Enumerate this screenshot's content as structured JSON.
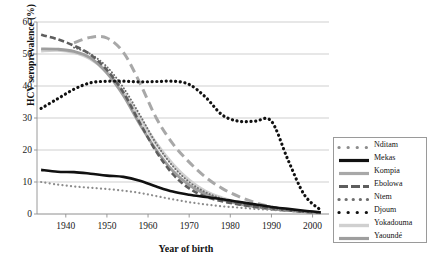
{
  "chart_data": {
    "type": "line",
    "title": "",
    "xlabel": "Year of birth",
    "ylabel": "HCV seroprevalence (%)",
    "xlim": [
      1933,
      2004
    ],
    "ylim": [
      0,
      60
    ],
    "xticks": [
      1940,
      1950,
      1960,
      1970,
      1980,
      1990,
      2000
    ],
    "yticks": [
      0,
      10,
      20,
      30,
      40,
      50,
      60
    ],
    "grid": "horizontal",
    "legend_position": "right",
    "series": [
      {
        "name": "Nditam",
        "color": "#8c8c8c",
        "style": "dotted-marker",
        "x": [
          1934,
          1938,
          1942,
          1946,
          1950,
          1954,
          1958,
          1962,
          1966,
          1970,
          1974,
          1978,
          1982,
          1986,
          1990,
          1994,
          1998,
          2002
        ],
        "values": [
          10.0,
          9.2,
          8.6,
          8.2,
          7.8,
          7.3,
          6.6,
          5.6,
          4.6,
          3.7,
          3.0,
          2.4,
          2.0,
          1.6,
          1.3,
          1.0,
          0.7,
          0.4
        ]
      },
      {
        "name": "Mekas",
        "color": "#111111",
        "style": "solid-thick",
        "x": [
          1934,
          1938,
          1942,
          1946,
          1950,
          1954,
          1958,
          1962,
          1966,
          1970,
          1974,
          1978,
          1982,
          1986,
          1990,
          1994,
          1998,
          2002
        ],
        "values": [
          13.8,
          13.2,
          13.1,
          12.6,
          12.0,
          11.6,
          10.4,
          8.6,
          7.0,
          6.0,
          5.3,
          4.6,
          3.8,
          3.0,
          2.2,
          1.6,
          1.0,
          0.5
        ]
      },
      {
        "name": "Kompia",
        "color": "#a8a8a8",
        "style": "long-dash",
        "x": [
          1942,
          1946,
          1950,
          1954,
          1958,
          1962,
          1966,
          1970,
          1974,
          1978,
          1982,
          1986,
          1990,
          1994
        ],
        "values": [
          53.5,
          55.2,
          55.0,
          50.5,
          41.0,
          30.0,
          22.0,
          16.2,
          11.5,
          8.0,
          5.5,
          3.6,
          2.2,
          1.2
        ]
      },
      {
        "name": "Ebolowa",
        "color": "#5e5e5e",
        "style": "dash-dot",
        "x": [
          1934,
          1938,
          1942,
          1946,
          1950,
          1954,
          1958,
          1962,
          1966,
          1970,
          1974,
          1978,
          1982,
          1986,
          1990,
          1994,
          1998,
          2002
        ],
        "values": [
          56.0,
          54.6,
          52.6,
          49.8,
          45.0,
          38.0,
          28.5,
          19.5,
          12.5,
          8.0,
          5.4,
          4.0,
          3.0,
          2.2,
          1.6,
          1.1,
          0.7,
          0.4
        ]
      },
      {
        "name": "Ntem",
        "color": "#6e6e6e",
        "style": "fine-dot",
        "x": [
          1942,
          1946,
          1950,
          1954,
          1958,
          1962,
          1966,
          1970,
          1974,
          1978,
          1982,
          1986,
          1990,
          1994,
          1998
        ],
        "values": [
          52.0,
          50.0,
          46.0,
          39.5,
          31.0,
          22.0,
          15.0,
          10.0,
          6.8,
          4.8,
          3.4,
          2.4,
          1.7,
          1.1,
          0.6
        ]
      },
      {
        "name": "Djoum",
        "color": "#111111",
        "style": "bold-dot",
        "x": [
          1934,
          1938,
          1942,
          1946,
          1950,
          1954,
          1958,
          1962,
          1966,
          1970,
          1974,
          1978,
          1982,
          1986,
          1990,
          1994,
          1998,
          2002
        ],
        "values": [
          33.0,
          36.0,
          39.0,
          41.0,
          41.5,
          41.5,
          41.3,
          41.4,
          41.5,
          40.5,
          36.5,
          31.0,
          29.0,
          29.0,
          29.0,
          17.0,
          6.0,
          1.2
        ]
      },
      {
        "name": "Yokadouma",
        "color": "#d0d0d0",
        "style": "solid-pale",
        "x": [
          1934,
          1938,
          1942,
          1946,
          1950,
          1954,
          1958,
          1962,
          1966,
          1970,
          1974,
          1978,
          1982,
          1986,
          1990,
          1994,
          1998,
          2002
        ],
        "values": [
          51.0,
          51.2,
          50.5,
          48.5,
          44.5,
          38.0,
          30.0,
          22.0,
          15.5,
          10.5,
          7.0,
          5.0,
          3.6,
          2.6,
          1.8,
          1.2,
          0.8,
          0.4
        ]
      },
      {
        "name": "Yaoundé",
        "color": "#9e9e9e",
        "style": "solid-mid",
        "x": [
          1934,
          1938,
          1942,
          1946,
          1950,
          1954,
          1958,
          1962,
          1966,
          1970,
          1974,
          1978,
          1982,
          1986,
          1990,
          1994,
          1998,
          2002
        ],
        "values": [
          51.6,
          51.5,
          50.8,
          48.8,
          44.0,
          37.0,
          28.0,
          20.0,
          13.5,
          9.0,
          6.2,
          4.4,
          3.2,
          2.3,
          1.6,
          1.1,
          0.7,
          0.3
        ]
      }
    ]
  },
  "legend": {
    "items": [
      {
        "label": "Nditam"
      },
      {
        "label": "Mekas"
      },
      {
        "label": "Kompia"
      },
      {
        "label": "Ebolowa"
      },
      {
        "label": "Ntem"
      },
      {
        "label": "Djoum"
      },
      {
        "label": "Yokadouma"
      },
      {
        "label": "Yaoundé"
      }
    ]
  }
}
